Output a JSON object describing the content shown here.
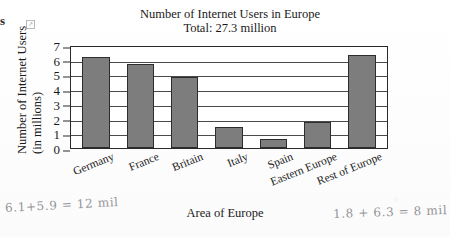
{
  "scan": {
    "edge_glyph": "s",
    "edge_mark": "↗"
  },
  "chart_data": {
    "type": "bar",
    "title": "Number of Internet Users in Europe",
    "subtitle": "Total: 27.3 million",
    "xlabel": "Area of Europe",
    "ylabel_line1": "Number of Internet Users",
    "ylabel_line2": "(in millions)",
    "categories": [
      "Germany",
      "France",
      "Britain",
      "Italy",
      "Spain",
      "Eastern Europe",
      "Rest of Europe"
    ],
    "values": [
      6.2,
      5.7,
      4.8,
      1.4,
      0.6,
      1.8,
      6.3
    ],
    "yticks": [
      7,
      6,
      5,
      4,
      3,
      2,
      1,
      0
    ],
    "ylim": [
      0,
      7
    ],
    "grid": true,
    "legend": "none",
    "bar_color": "#7d7d7d",
    "bar_edge_color": "#2d2d2d",
    "axis_color": "#2a2a2a"
  },
  "annotations": {
    "left_note": "6.1+5.9 = 12 mil",
    "right_note": "1.8 + 6.3 = 8 mil"
  }
}
